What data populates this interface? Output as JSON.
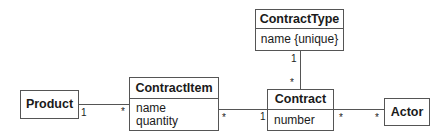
{
  "diagram": {
    "type": "UML class diagram",
    "classes": [
      {
        "id": "product",
        "name": "Product",
        "attributes": []
      },
      {
        "id": "contractitem",
        "name": "ContractItem",
        "attributes": [
          "name",
          "quantity"
        ]
      },
      {
        "id": "contracttype",
        "name": "ContractType",
        "attributes": [
          "name {unique}"
        ]
      },
      {
        "id": "contract",
        "name": "Contract",
        "attributes": [
          "number"
        ]
      },
      {
        "id": "actor",
        "name": "Actor",
        "attributes": []
      }
    ],
    "associations": [
      {
        "from": "Product",
        "to": "ContractItem",
        "from_mult": "1",
        "to_mult": "*"
      },
      {
        "from": "ContractItem",
        "to": "Contract",
        "from_mult": "*",
        "to_mult": "1"
      },
      {
        "from": "ContractType",
        "to": "Contract",
        "from_mult": "1",
        "to_mult": "*"
      },
      {
        "from": "Contract",
        "to": "Actor",
        "from_mult": "*",
        "to_mult": "*"
      }
    ]
  },
  "labels": {
    "product": "Product",
    "contractitem": "ContractItem",
    "contractitem_attr1": "name",
    "contractitem_attr2": "quantity",
    "contracttype": "ContractType",
    "contracttype_attr1": "name {unique}",
    "contract": "Contract",
    "contract_attr1": "number",
    "actor": "Actor",
    "m_product_ci_1": "1",
    "m_product_ci_star": "*",
    "m_ci_contract_star": "*",
    "m_ci_contract_1": "1",
    "m_ct_contract_1": "1",
    "m_ct_contract_star": "*",
    "m_contract_actor_star1": "*",
    "m_contract_actor_star2": "*"
  }
}
